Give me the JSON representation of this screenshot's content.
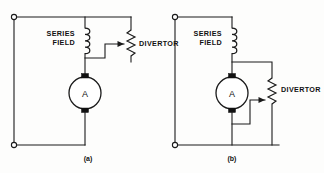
{
  "figure": {
    "background_color": "#fdfdfc",
    "ink_color": "#1a1a1a",
    "width": 324,
    "height": 173
  },
  "diagrams": [
    {
      "id": "a",
      "caption": "(a)",
      "series_field_label_line1": "SERIES",
      "series_field_label_line2": "FIELD",
      "divertor_label": "DIVERTOR",
      "machine_label": "A",
      "machine_type": "armature",
      "divertor_orientation": "vertical-right-of-field",
      "tap_arrow_direction": "right",
      "coil_turns": 4,
      "terminals": 2
    },
    {
      "id": "b",
      "caption": "(b)",
      "series_field_label_line1": "SERIES",
      "series_field_label_line2": "FIELD",
      "divertor_label": "DIVERTOR",
      "machine_label": "A",
      "machine_type": "armature",
      "divertor_orientation": "vertical-right-of-armature",
      "tap_arrow_direction": "right",
      "coil_turns": 4,
      "terminals": 2
    }
  ]
}
